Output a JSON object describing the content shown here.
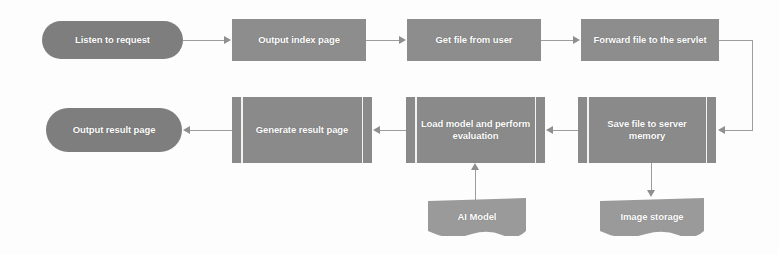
{
  "diagram": {
    "background_color": "#fdfdfd",
    "node_fill_terminator": "#7e7e7e",
    "node_fill_process": "#8d8d8d",
    "node_fill_predefined": "#8a8a8a",
    "node_fill_document": "#9a9a9a",
    "label_color": "#ffffff",
    "connector_color": "#9d9d9d",
    "nodes": [
      {
        "id": "listen",
        "label": "Listen to request",
        "shape": "terminator",
        "x": 42,
        "y": 21,
        "w": 141,
        "h": 38
      },
      {
        "id": "index",
        "label": "Output index page",
        "shape": "process",
        "x": 232,
        "y": 19,
        "w": 134,
        "h": 42
      },
      {
        "id": "getfile",
        "label": "Get file from user",
        "shape": "process",
        "x": 407,
        "y": 19,
        "w": 134,
        "h": 42
      },
      {
        "id": "forward",
        "label": "Forward file to the servlet",
        "shape": "process",
        "x": 581,
        "y": 19,
        "w": 138,
        "h": 42
      },
      {
        "id": "result",
        "label": "Output result page",
        "shape": "terminator",
        "x": 46,
        "y": 108,
        "w": 136,
        "h": 44
      },
      {
        "id": "generate",
        "label": "Generate result page",
        "shape": "predefined",
        "x": 232,
        "y": 97,
        "w": 140,
        "h": 66
      },
      {
        "id": "loadmodel",
        "label": "Load model and perform evaluation",
        "shape": "predefined",
        "x": 406,
        "y": 97,
        "w": 139,
        "h": 66
      },
      {
        "id": "savefile",
        "label": "Save file to server memory",
        "shape": "predefined",
        "x": 578,
        "y": 97,
        "w": 138,
        "h": 66
      },
      {
        "id": "aimodel",
        "label": "AI Model",
        "shape": "document",
        "x": 428,
        "y": 198,
        "w": 98,
        "h": 38
      },
      {
        "id": "imgstore",
        "label": "Image storage",
        "shape": "document",
        "x": 600,
        "y": 198,
        "w": 104,
        "h": 38
      }
    ],
    "edges": [
      {
        "from": "listen",
        "to": "index",
        "direction": "right"
      },
      {
        "from": "index",
        "to": "getfile",
        "direction": "right"
      },
      {
        "from": "getfile",
        "to": "forward",
        "direction": "right"
      },
      {
        "from": "forward",
        "to": "savefile",
        "direction": "left",
        "routing": "elbow-right-down"
      },
      {
        "from": "savefile",
        "to": "loadmodel",
        "direction": "left"
      },
      {
        "from": "loadmodel",
        "to": "generate",
        "direction": "left"
      },
      {
        "from": "generate",
        "to": "result",
        "direction": "left"
      },
      {
        "from": "aimodel",
        "to": "loadmodel",
        "direction": "up"
      },
      {
        "from": "savefile",
        "to": "imgstore",
        "direction": "down"
      }
    ]
  }
}
